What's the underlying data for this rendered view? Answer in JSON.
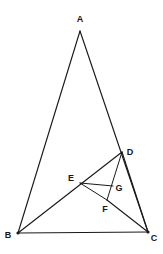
{
  "figure": {
    "type": "geometry-diagram",
    "width": 163,
    "height": 254,
    "background_color": "#ffffff",
    "stroke_color": "#1a1a1a",
    "label_color": "#171717"
  },
  "points": [
    {
      "id": "A",
      "label": "A",
      "x": 80,
      "y": 31,
      "label_x": 80,
      "label_y": 19
    },
    {
      "id": "B",
      "label": "B",
      "x": 18,
      "y": 233,
      "label_x": 8,
      "label_y": 235
    },
    {
      "id": "C",
      "label": "C",
      "x": 148,
      "y": 232,
      "label_x": 154,
      "label_y": 238
    },
    {
      "id": "D",
      "label": "D",
      "x": 122,
      "y": 152,
      "label_x": 130,
      "label_y": 152
    },
    {
      "id": "E",
      "label": "E",
      "x": 80,
      "y": 183,
      "label_x": 71,
      "label_y": 178
    },
    {
      "id": "F",
      "label": "F",
      "x": 107,
      "y": 200,
      "label_x": 105,
      "label_y": 209
    },
    {
      "id": "G",
      "label": "G",
      "x": 113,
      "y": 186,
      "label_x": 119,
      "label_y": 188
    }
  ],
  "segments": [
    {
      "id": "AB",
      "from": "A",
      "to": "B",
      "name": "segment-ab"
    },
    {
      "id": "AC",
      "from": "A",
      "to": "C",
      "name": "segment-ac"
    },
    {
      "id": "BC",
      "from": "B",
      "to": "C",
      "name": "segment-bc"
    },
    {
      "id": "BD",
      "from": "B",
      "to": "D",
      "name": "segment-bd"
    },
    {
      "id": "DF",
      "from": "D",
      "to": "F",
      "name": "segment-df"
    },
    {
      "id": "DC",
      "from": "D",
      "to": "C",
      "name": "segment-dc"
    },
    {
      "id": "EG",
      "from": "E",
      "to": "G",
      "name": "segment-eg"
    },
    {
      "id": "EF",
      "from": "E",
      "to": "F",
      "name": "segment-ef"
    },
    {
      "id": "FC",
      "from": "F",
      "to": "C",
      "name": "segment-fc"
    }
  ],
  "vertex_dots": [
    "B",
    "C"
  ]
}
